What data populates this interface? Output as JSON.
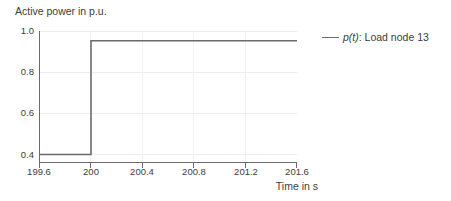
{
  "chart_data": {
    "type": "line",
    "title": "",
    "ylabel": "Active power in p.u.",
    "xlabel": "Time in s",
    "xlim": [
      199.6,
      201.6
    ],
    "ylim": [
      0.4,
      1.0
    ],
    "grid": true,
    "legend_position": "right",
    "x_ticks": [
      "199.6",
      "200",
      "200.4",
      "200.8",
      "201.2",
      "201.6"
    ],
    "x_tick_values": [
      199.6,
      200,
      200.4,
      200.8,
      201.2,
      201.6
    ],
    "y_ticks": [
      "1.0",
      "0.8",
      "0.6",
      "0.4"
    ],
    "y_tick_values": [
      1.0,
      0.8,
      0.6,
      0.4
    ],
    "series": [
      {
        "name": "p(t): Load node 13",
        "name_symbol": "p(t)",
        "name_rest": ": Load node 13",
        "color": "#6b6b6b",
        "x": [
          199.6,
          200.0,
          200.0,
          201.6
        ],
        "values": [
          0.4,
          0.4,
          0.955,
          0.955
        ],
        "step_time": 200.0,
        "value_before_step": 0.4,
        "value_after_step": 0.955
      }
    ],
    "annotations": []
  },
  "legend": {
    "entries": [
      {
        "symbol": "p(t)",
        "rest": ": Load node 13"
      }
    ]
  },
  "colors": {
    "line": "#6b6b6b",
    "axis": "#6b6b6b",
    "grid": "#ededed",
    "text": "#3c3c3c",
    "background": "#ffffff"
  }
}
